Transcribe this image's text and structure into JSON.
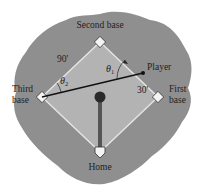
{
  "diagram": {
    "type": "baseball-diamond",
    "colors": {
      "background": "#ffffff",
      "field": "#8f8f8f",
      "infield": "#b3b3b3",
      "baseline": "#e6e6e6",
      "base": "#f4f4f4",
      "player_line": "#111111",
      "mound_line": "#555555",
      "mound": "#2a2a2a"
    },
    "labels": {
      "second_base": "Second base",
      "third_base_line1": "Third",
      "third_base_line2": "base",
      "first_base_line1": "First",
      "first_base_line2": "base",
      "home": "Home",
      "player": "Player",
      "side_length": "90'",
      "player_distance": "30'",
      "theta1": "θ",
      "theta1_sub": "1",
      "theta2": "θ",
      "theta2_sub": "2"
    }
  }
}
